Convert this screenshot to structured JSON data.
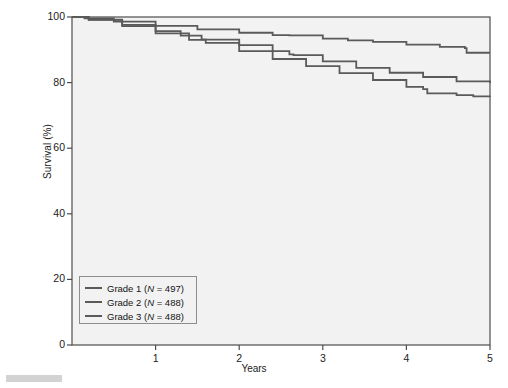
{
  "chart_data": {
    "type": "line",
    "title": "",
    "subtitle": "",
    "xlabel": "Years",
    "ylabel": "Survival (%)",
    "xlim": [
      0,
      5
    ],
    "ylim": [
      0,
      100
    ],
    "xticks": [
      "1",
      "2",
      "3",
      "4",
      "5"
    ],
    "xtick_values": [
      1,
      2,
      3,
      4,
      5
    ],
    "yticks": [
      "0",
      "20",
      "40",
      "60",
      "80",
      "100"
    ],
    "ytick_values": [
      0,
      20,
      40,
      60,
      80,
      100
    ],
    "grid": false,
    "legend_position": "lower-left",
    "plot_background": "#f2f2f2",
    "axis_color": "#4d4d4d",
    "series": [
      {
        "name": "Grade 1",
        "label": "Grade 1 (N = 497)",
        "n": 497,
        "color": "#5a5a5a",
        "x": [
          0,
          0.15,
          0.5,
          1.0,
          1.5,
          2.0,
          2.4,
          2.6,
          3.0,
          3.3,
          3.6,
          4.0,
          4.4,
          4.7,
          4.72,
          5.0
        ],
        "values": [
          100,
          99.6,
          98.6,
          97.3,
          96.2,
          95.2,
          94.5,
          94.4,
          93.4,
          92.9,
          92.4,
          91.6,
          90.9,
          90.5,
          89.1,
          89.1
        ]
      },
      {
        "name": "Grade 2",
        "label": "Grade 2 (N = 488)",
        "n": 488,
        "color": "#5a5a5a",
        "x": [
          0,
          0.2,
          0.6,
          1.0,
          1.3,
          1.55,
          1.6,
          2.0,
          2.4,
          2.6,
          2.65,
          3.0,
          3.4,
          3.8,
          4.2,
          4.6,
          5.0
        ],
        "values": [
          100,
          99.2,
          97.6,
          95.7,
          94.3,
          93.2,
          93.1,
          91.4,
          89.6,
          88.6,
          88.4,
          86.5,
          84.5,
          83.0,
          81.7,
          80.4,
          79.9
        ]
      },
      {
        "name": "Grade 3",
        "label": "Grade 3 (N = 488)",
        "n": 488,
        "color": "#5a5a5a",
        "x": [
          0,
          0.2,
          0.6,
          1.0,
          1.4,
          1.6,
          2.0,
          2.4,
          2.8,
          3.2,
          3.6,
          4.0,
          4.2,
          4.25,
          4.6,
          4.8,
          5.0
        ],
        "values": [
          100,
          99.1,
          97.2,
          95.0,
          93.0,
          92.1,
          89.6,
          87.2,
          85.0,
          82.9,
          80.8,
          78.7,
          78.0,
          76.7,
          76.2,
          75.8,
          75.6
        ]
      }
    ]
  },
  "legend": {
    "items": [
      {
        "label_prefix": "Grade 1 (",
        "n_symbol": "N",
        "label_suffix": " = 497)"
      },
      {
        "label_prefix": "Grade 2 (",
        "n_symbol": "N",
        "label_suffix": " = 488)"
      },
      {
        "label_prefix": "Grade 3 (",
        "n_symbol": "N",
        "label_suffix": " = 488)"
      }
    ]
  }
}
